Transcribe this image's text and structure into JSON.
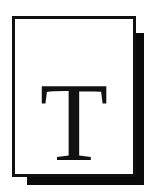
{
  "icon": {
    "name": "text-document-icon",
    "letter": "T",
    "colors": {
      "background": "#ffffff",
      "page": "#ffffff",
      "border": "#111111",
      "shadow": "#0a0a0a",
      "letter": "#111111"
    }
  }
}
